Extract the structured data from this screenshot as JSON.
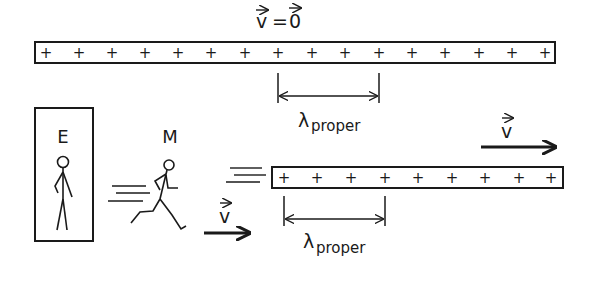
{
  "top_label": {
    "text": "v = 0",
    "v": "v",
    "eq": "=",
    "zero": "0"
  },
  "top_rod": {
    "charges": [
      "+",
      "+",
      "+",
      "+",
      "+",
      "+",
      "+",
      "+",
      "+",
      "+",
      "+",
      "+",
      "+",
      "+",
      "+",
      "+"
    ]
  },
  "top_bracket": {
    "symbol": "λ",
    "subscript": "proper"
  },
  "observer_e": {
    "label": "E"
  },
  "observer_m": {
    "label": "M"
  },
  "bottom_rod": {
    "charges": [
      "+",
      "+",
      "+",
      "+",
      "+",
      "+",
      "+",
      "+",
      "+"
    ]
  },
  "bottom_bracket": {
    "symbol": "λ",
    "subscript": "proper"
  },
  "velocity_right": {
    "label": "v"
  },
  "velocity_m": {
    "label": "v"
  },
  "colors": {
    "ink": "#1a1a1a",
    "background": "#ffffff"
  }
}
